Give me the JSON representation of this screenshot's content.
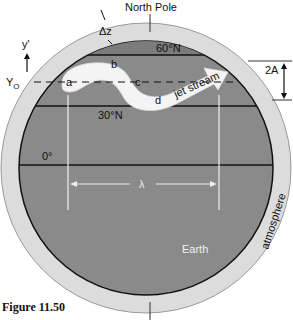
{
  "figure": {
    "caption": "Figure 11.50",
    "labels": {
      "north_pole": "North Pole",
      "delta_z": "Δz",
      "lat_60": "60°N",
      "lat_30": "30°N",
      "lat_0": "0°",
      "y_prime": "y'",
      "y_o": "YO",
      "y_o_main": "Y",
      "y_o_sub": "O",
      "two_a": "2A",
      "lambda": "λ",
      "earth": "Earth",
      "atmosphere": "atmosphere",
      "jet_stream": "jet stream",
      "point_a": "a",
      "point_b": "b",
      "point_c": "c",
      "point_d": "d"
    },
    "colors": {
      "atmosphere": "#dcdcdc",
      "earth": "#8a8a8a",
      "jet": "#f4f4f4",
      "lines": "#111111"
    }
  }
}
